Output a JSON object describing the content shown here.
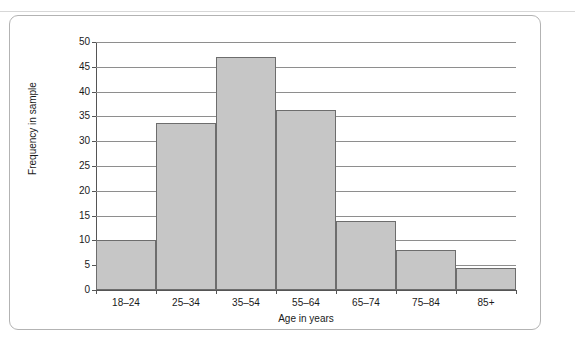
{
  "figure": {
    "frame_border_color": "#b3b3b3",
    "background_color": "#ffffff"
  },
  "chart_data": {
    "type": "bar",
    "title": "",
    "subtitle": "",
    "xlabel": "Age in years",
    "ylabel": "Frequency in sample",
    "categories": [
      "18–24",
      "25–34",
      "35–54",
      "55–64",
      "65–74",
      "75–84",
      "85+"
    ],
    "values": [
      10,
      33.7,
      47,
      36.3,
      13.9,
      8,
      4.5
    ],
    "series": [
      {
        "name": "Frequency in sample",
        "values": [
          10,
          33.7,
          47,
          36.3,
          13.9,
          8,
          4.5
        ]
      }
    ],
    "ylim": [
      0,
      50
    ],
    "xlim": [
      0,
      7
    ],
    "y_ticks": [
      0,
      5,
      10,
      15,
      20,
      25,
      30,
      35,
      40,
      45,
      50
    ],
    "y_tick_labels": [
      "0",
      "5",
      "10",
      "15",
      "20",
      "25",
      "30",
      "35",
      "40",
      "45",
      "50"
    ],
    "x_tick_labels": [
      "18–24",
      "25–34",
      "35–54",
      "55–64",
      "65–74",
      "75–84",
      "85+"
    ],
    "grid": true,
    "grid_axis": "y",
    "legend": false,
    "legend_position": "none",
    "bar_fill_color": "#c6c6c6",
    "bar_edge_color": "#6d6d6d",
    "grid_color": "#8e8e8e",
    "axis_color": "#555555",
    "bar_gap": 0,
    "annotations": []
  }
}
